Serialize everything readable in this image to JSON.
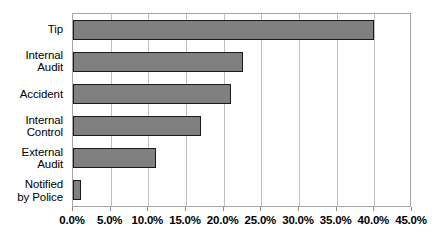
{
  "chart_data": {
    "type": "bar",
    "orientation": "horizontal",
    "title": "",
    "subtitle": "",
    "xlabel": "",
    "ylabel": "",
    "categories": [
      "Tip",
      "Internal\nAudit",
      "Accident",
      "Internal\nControl",
      "External\nAudit",
      "Notified\nby Police"
    ],
    "values": [
      40.0,
      22.5,
      21.0,
      17.0,
      11.0,
      1.0
    ],
    "value_format": "percent",
    "xlim": [
      0,
      45
    ],
    "xticks": [
      0,
      5,
      10,
      15,
      20,
      25,
      30,
      35,
      40,
      45
    ],
    "xtick_labels": [
      "0.0%",
      "5.0%",
      "10.0%",
      "15.0%",
      "20.0%",
      "25.0%",
      "30.0%",
      "35.0%",
      "40.0%",
      "45.0%"
    ],
    "grid": {
      "vertical": true,
      "horizontal": false
    },
    "legend": {
      "visible": false,
      "position": "none",
      "entries": []
    },
    "annotations": [],
    "colors": {
      "bar_fill": "#808080",
      "bar_border": "#1a1a1a",
      "gridline": "#bfbfbf",
      "plot_border": "#a6a6a6",
      "plot_background": "#ffffff",
      "page_background": "#ffffff",
      "text": "#000000"
    }
  }
}
